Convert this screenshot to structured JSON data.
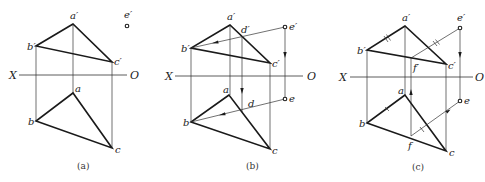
{
  "figure": {
    "colors": {
      "line": "#1a1a1a",
      "thin": "#333333",
      "background": "#ffffff"
    },
    "panels": [
      {
        "id": "a",
        "caption": "(a)",
        "axis": {
          "left_label": "X",
          "right_label": "O"
        },
        "labels": {
          "a_prime": "a′",
          "b_prime": "b′",
          "c_prime": "c′",
          "e_prime": "e′",
          "a": "a",
          "b": "b",
          "c": "c"
        }
      },
      {
        "id": "b",
        "caption": "(b)",
        "axis": {
          "left_label": "X",
          "right_label": "O"
        },
        "labels": {
          "a_prime": "a′",
          "b_prime": "b′",
          "c_prime": "c′",
          "d_prime": "d′",
          "e_prime": "e′",
          "a": "a",
          "b": "b",
          "c": "c",
          "d": "d",
          "e": "e"
        }
      },
      {
        "id": "c",
        "caption": "(c)",
        "axis": {
          "left_label": "X",
          "right_label": "O"
        },
        "labels": {
          "a_prime": "a′",
          "b_prime": "b′",
          "c_prime": "c′",
          "e_prime": "e′",
          "f_prime": "f′",
          "a": "a",
          "b": "b",
          "c": "c",
          "e": "e",
          "f": "f"
        }
      }
    ]
  }
}
